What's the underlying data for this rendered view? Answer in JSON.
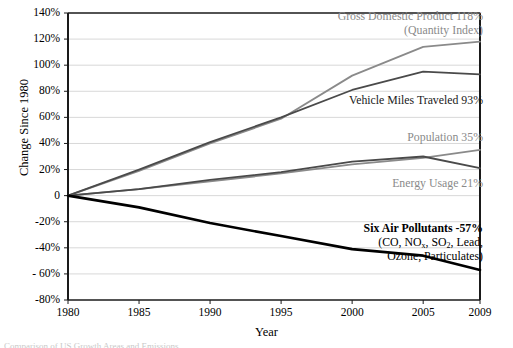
{
  "chart_data": {
    "type": "line",
    "title": "",
    "xlabel": "Year",
    "ylabel": "Change Since 1980",
    "xlim": [
      1980,
      2009
    ],
    "ylim": [
      -80,
      140
    ],
    "grid": true,
    "legend_position": "inline-annotations",
    "x": [
      1980,
      1985,
      1990,
      1995,
      2000,
      2005,
      2009
    ],
    "xticklabels": [
      "1980",
      "1985",
      "1990",
      "1995",
      "2000",
      "2005",
      "2009"
    ],
    "yticklabels": [
      "140%",
      "120%",
      "100%",
      "80%",
      "60%",
      "40%",
      "20%",
      "0",
      "-20%",
      "-40%",
      "- 60%",
      "-80%"
    ],
    "ytickvalues": [
      140,
      120,
      100,
      80,
      60,
      40,
      20,
      0,
      -20,
      -40,
      -60,
      -80
    ],
    "series": [
      {
        "name": "Gross Domestic Product (Quantity Index)",
        "color": "#8a8a8a",
        "width": 1.8,
        "values": [
          0,
          19,
          40,
          59,
          92,
          114,
          118
        ],
        "end_value": "118%"
      },
      {
        "name": "Vehicle Miles Traveled",
        "color": "#4a4a4a",
        "width": 1.8,
        "values": [
          0,
          20,
          41,
          60,
          81,
          95,
          93
        ],
        "end_value": "93%"
      },
      {
        "name": "Population",
        "color": "#8a8a8a",
        "width": 1.8,
        "values": [
          0,
          5,
          11,
          17,
          24,
          29,
          35
        ],
        "end_value": "35%"
      },
      {
        "name": "Energy Usage",
        "color": "#4a4a4a",
        "width": 1.8,
        "values": [
          0,
          5,
          12,
          18,
          26,
          30,
          21
        ],
        "end_value": "21%"
      },
      {
        "name": "Six Air Pollutants",
        "color": "#000000",
        "width": 2.6,
        "values": [
          0,
          -9,
          -21,
          -31,
          -41,
          -46,
          -57
        ],
        "end_value": "-57%"
      }
    ],
    "annotations": [
      {
        "id": "gdp",
        "line1": "Gross Domestic Product  118%",
        "line2": "(Quantity Index)",
        "color": "#8a8a8a"
      },
      {
        "id": "vmt",
        "line1": "Vehicle Miles Traveled  93%",
        "line2": "",
        "color": "#1a1a1a"
      },
      {
        "id": "population",
        "line1": "Population  35%",
        "line2": "",
        "color": "#8a8a8a"
      },
      {
        "id": "energy",
        "line1": "Energy Usage  21%",
        "line2": "",
        "color": "#8a8a8a"
      },
      {
        "id": "pollutants",
        "line1": "Six Air Pollutants  -57%",
        "line2_pre": "(CO, NO",
        "line2_sub": "x",
        "line2_mid": ", SO",
        "line2_sub2": "2",
        "line2_post": ", Lead,",
        "line3": "Ozone, Particulates)",
        "color": "#000000"
      }
    ],
    "footnote": "Comparison of US Growth Areas and Emissions"
  },
  "axis": {
    "ylabel": "Change Since 1980",
    "xlabel": "Year"
  }
}
